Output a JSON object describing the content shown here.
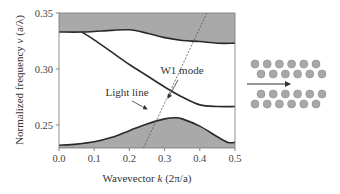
{
  "chart_data": {
    "type": "line",
    "title": "",
    "xlabel": "Wavevector k (2π/a)",
    "ylabel": "Normalized frequency ν (a/λ)",
    "xlim": [
      0.0,
      0.5
    ],
    "ylim": [
      0.2295,
      0.35
    ],
    "x_ticks": [
      "0.0",
      "0.1",
      "0.2",
      "0.3",
      "0.4",
      "0.5"
    ],
    "y_ticks": [
      "0.25",
      "0.30",
      "0.35"
    ],
    "grid": false,
    "legend": null,
    "series": [
      {
        "name": "Upper bulk band edge (shaded above)",
        "fill": "above",
        "x": [
          0.0,
          0.065,
          0.1,
          0.15,
          0.2,
          0.25,
          0.3,
          0.35,
          0.4,
          0.45,
          0.5
        ],
        "y": [
          0.333,
          0.333,
          0.3335,
          0.3345,
          0.335,
          0.332,
          0.328,
          0.3255,
          0.3245,
          0.323,
          0.323
        ]
      },
      {
        "name": "W1 mode",
        "x": [
          0.065,
          0.1,
          0.15,
          0.2,
          0.25,
          0.3,
          0.35,
          0.4,
          0.45,
          0.5
        ],
        "y": [
          0.333,
          0.326,
          0.315,
          0.304,
          0.294,
          0.284,
          0.275,
          0.268,
          0.2665,
          0.2665
        ]
      },
      {
        "name": "Lower bulk band edge (shaded below)",
        "fill": "below",
        "x": [
          0.0,
          0.05,
          0.1,
          0.15,
          0.2,
          0.25,
          0.3,
          0.33,
          0.35,
          0.4,
          0.45,
          0.48,
          0.5
        ],
        "y": [
          0.232,
          0.233,
          0.235,
          0.239,
          0.245,
          0.251,
          0.2555,
          0.2565,
          0.2555,
          0.249,
          0.2395,
          0.2345,
          0.2345
        ]
      },
      {
        "name": "Light line",
        "style": "dashed",
        "x": [
          0.24,
          0.42
        ],
        "y": [
          0.2295,
          0.35
        ]
      }
    ],
    "annotations": [
      {
        "text": "W1 mode",
        "arrow_to": [
          0.36,
          0.274
        ]
      },
      {
        "text": "Light line",
        "arrow_to": [
          0.255,
          0.2535
        ]
      }
    ],
    "inset": {
      "description": "W1 photonic crystal waveguide schematic: two rows of holes above and below a missing row, with arrow indicating propagation direction",
      "rows_above": 2,
      "rows_below": 2,
      "holes_per_row": 6
    }
  },
  "labels": {
    "xlabel_prefix": "Wavevector ",
    "xlabel_var": "k",
    "xlabel_unit": " (2π/a)",
    "ylabel_prefix": "Normalized frequency ",
    "ylabel_var": "ν",
    "ylabel_unit": " (a/λ)",
    "w1_mode": "W1 mode",
    "light_line": "Light line"
  },
  "colors": {
    "band_fill": "#a9a9a9",
    "curve": "#2a2a2a",
    "axis": "#555555",
    "hole": "#a8a8a8",
    "hole_stroke": "#8a8a8a"
  }
}
